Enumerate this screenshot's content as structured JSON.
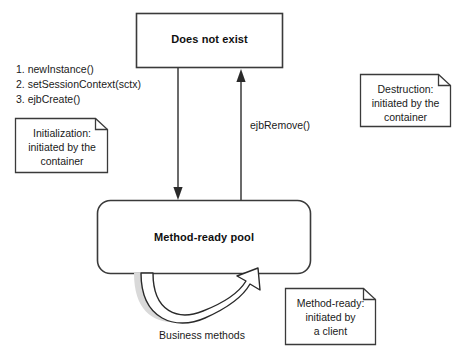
{
  "diagram": {
    "colors": {
      "stroke": "#3a3a3a",
      "text": "#1a1a1a",
      "note_fill": "#ffffff",
      "shadow_fill": "#d9d9d9",
      "background": "#ffffff"
    },
    "states": [
      {
        "id": "does-not-exist",
        "label": "Does not exist"
      },
      {
        "id": "method-ready-pool",
        "label": "Method-ready pool"
      }
    ],
    "steps": {
      "items": [
        "1. newInstance()",
        "2. setSessionContext(sctx)",
        "3. ejbCreate()"
      ]
    },
    "notes": [
      {
        "id": "initialization",
        "line1": "Initialization:",
        "line2": "initiated by the",
        "line3": "container"
      },
      {
        "id": "destruction",
        "line1": "Destruction:",
        "line2": "initiated by the",
        "line3": "container"
      },
      {
        "id": "method-ready",
        "line1": "Method-ready:",
        "line2": "initiated by",
        "line3": "a client"
      }
    ],
    "edges": [
      {
        "id": "create",
        "label": "",
        "direction": "down",
        "from": "does-not-exist",
        "to": "method-ready-pool"
      },
      {
        "id": "ejb-remove",
        "label": "ejbRemove()",
        "direction": "up",
        "from": "method-ready-pool",
        "to": "does-not-exist"
      },
      {
        "id": "business-methods",
        "label": "Business methods",
        "direction": "loop",
        "from": "method-ready-pool",
        "to": "method-ready-pool"
      }
    ]
  }
}
